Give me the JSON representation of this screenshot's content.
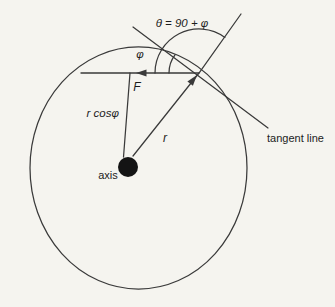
{
  "figure": {
    "type": "physics-diagram",
    "labels": {
      "theta_equation": "θ = 90 + φ",
      "phi": "φ",
      "force": "F",
      "moment_arm": "r cosφ",
      "radius": "r",
      "axis": "axis",
      "tangent_line": "tangent line"
    },
    "colors": {
      "background": "#f5f4ef",
      "ink": "#3a3a3a",
      "text": "#1c1c1c",
      "axis_dot": "#141414"
    }
  }
}
